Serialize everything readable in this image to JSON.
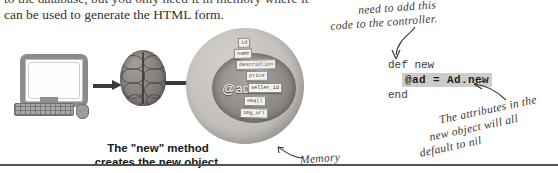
{
  "body_text": {
    "line1": "to the database, but you only need it in memory where it",
    "line2": "can be used to generate the HTML form."
  },
  "figure": {
    "computer_icon": "desktop-computer",
    "brain_icon": "brain",
    "memory_label": "Memory",
    "object_variable": "@ad",
    "attributes": [
      "id",
      "name",
      "description",
      "price",
      "seller_id",
      "email",
      "img_url"
    ],
    "caption": {
      "line1": "The \"new\" method",
      "line2": "creates the new object."
    }
  },
  "annotations": {
    "top_note": {
      "line1": "need to add this",
      "line2": "code to the controller."
    },
    "bottom_note": {
      "line1": "The attributes in the",
      "line2": "new object will all",
      "line3": "default to nil"
    }
  },
  "code": {
    "line1": "def new",
    "line2_highlighted": "@ad = Ad.new",
    "line3": "end"
  },
  "colors": {
    "ink": "#3b3835",
    "body_text": "#33302e",
    "code_highlight": "#cfcdca",
    "rule": "#56534f"
  }
}
